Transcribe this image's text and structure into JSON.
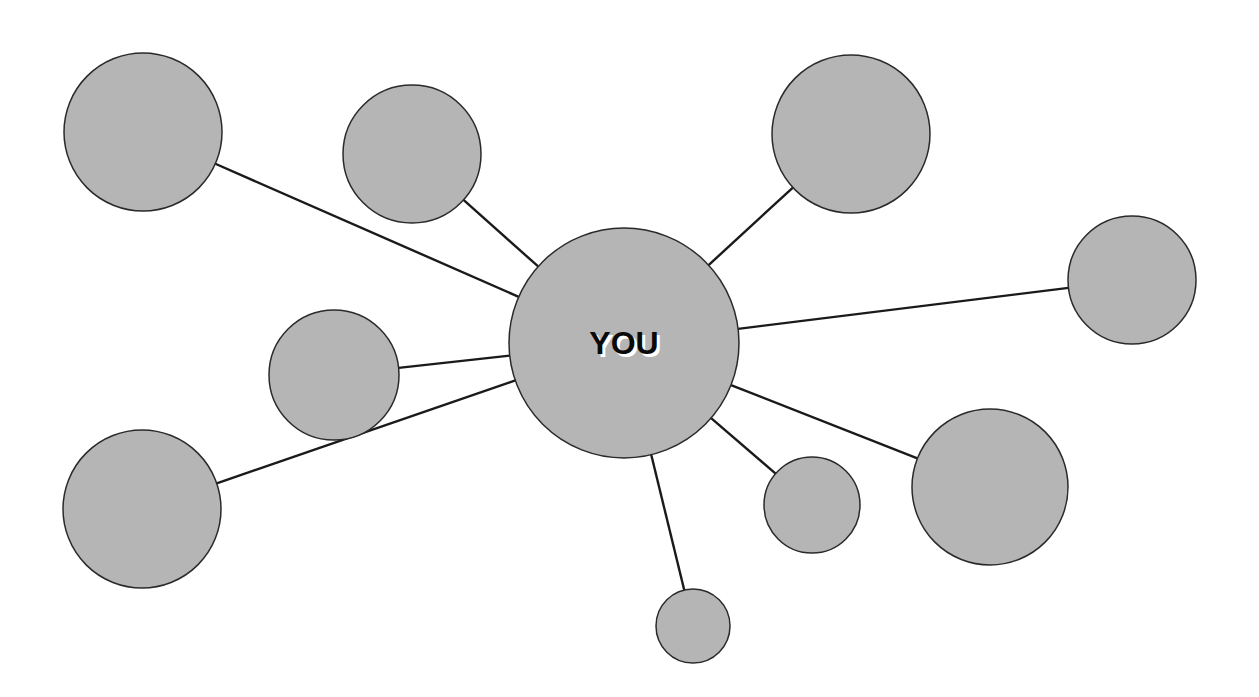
{
  "diagram": {
    "type": "hub-and-spoke network",
    "colors": {
      "node_fill": "#b5b5b5",
      "node_stroke": "#2a2a2a",
      "edge": "#1a1a1a",
      "background": "#ffffff"
    },
    "center": {
      "label": "YOU",
      "cx": 624,
      "cy": 343,
      "r": 115
    },
    "nodes": [
      {
        "id": "n1",
        "label": "",
        "cx": 143,
        "cy": 132,
        "r": 79
      },
      {
        "id": "n2",
        "label": "",
        "cx": 412,
        "cy": 154,
        "r": 69
      },
      {
        "id": "n3",
        "label": "",
        "cx": 851,
        "cy": 134,
        "r": 79
      },
      {
        "id": "n4",
        "label": "",
        "cx": 1132,
        "cy": 280,
        "r": 64
      },
      {
        "id": "n5",
        "label": "",
        "cx": 334,
        "cy": 375,
        "r": 65
      },
      {
        "id": "n6",
        "label": "",
        "cx": 142,
        "cy": 509,
        "r": 79
      },
      {
        "id": "n7",
        "label": "",
        "cx": 990,
        "cy": 487,
        "r": 78
      },
      {
        "id": "n8",
        "label": "",
        "cx": 812,
        "cy": 505,
        "r": 48
      },
      {
        "id": "n9",
        "label": "",
        "cx": 693,
        "cy": 626,
        "r": 37
      }
    ]
  }
}
